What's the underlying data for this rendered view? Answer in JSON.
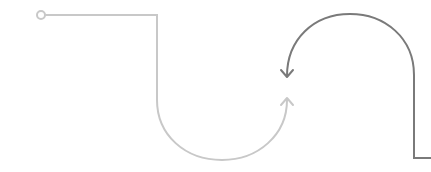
{
  "diagram": {
    "type": "flow-path",
    "width": 431,
    "height": 172,
    "colors": {
      "background": "#ffffff",
      "light_path": "#c8c8c8",
      "dark_path": "#7a7a7a"
    },
    "elements": [
      {
        "id": "start-node",
        "shape": "circle",
        "cx": 41,
        "cy": 15,
        "r": 4,
        "color": "#c8c8c8"
      },
      {
        "id": "light-path",
        "shape": "path",
        "from": [
          45,
          15
        ],
        "to": [
          287,
          100
        ],
        "arrow": "up",
        "color": "#c8c8c8"
      },
      {
        "id": "dark-path",
        "shape": "path",
        "from": [
          431,
          158
        ],
        "to": [
          287,
          76
        ],
        "arrow": "down",
        "color": "#7a7a7a"
      }
    ]
  }
}
